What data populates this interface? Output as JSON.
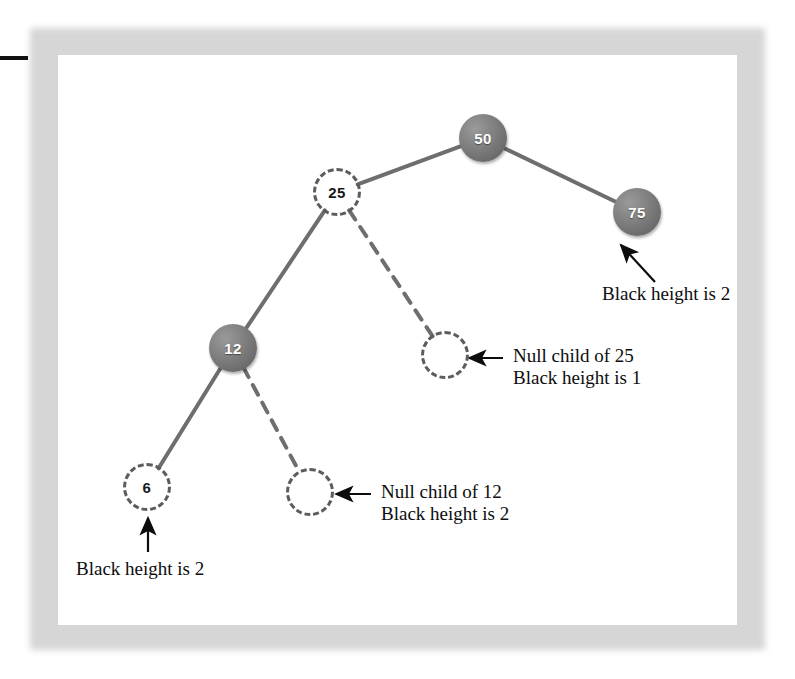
{
  "figure": {
    "kind": "red-black-tree-black-height-diagram",
    "page_background": "#ffffff",
    "frame_color": "#cfcfcf",
    "edge_color": "#6e6e6e",
    "black_node_fill": "#767676",
    "black_node_text_color": "#ffffff",
    "red_node_stroke": "#5c5c5c",
    "red_node_text_color": "#1a1a1a",
    "annotation_text_color": "#0d0d0d"
  },
  "nodes": [
    {
      "id": "n50",
      "label": "50",
      "color": "black",
      "filled": true,
      "cx": 483,
      "cy": 138,
      "r": 24
    },
    {
      "id": "n25",
      "label": "25",
      "color": "red",
      "filled": false,
      "cx": 337,
      "cy": 192,
      "r": 24
    },
    {
      "id": "n75",
      "label": "75",
      "color": "black",
      "filled": true,
      "cx": 637,
      "cy": 212,
      "r": 24
    },
    {
      "id": "n12",
      "label": "12",
      "color": "black",
      "filled": true,
      "cx": 233,
      "cy": 348,
      "r": 24
    },
    {
      "id": "null25",
      "label": "",
      "color": "null",
      "filled": false,
      "cx": 445,
      "cy": 355,
      "r": 24
    },
    {
      "id": "n6",
      "label": "6",
      "color": "red",
      "filled": false,
      "cx": 147,
      "cy": 487,
      "r": 24
    },
    {
      "id": "null12",
      "label": "",
      "color": "null",
      "filled": false,
      "cx": 310,
      "cy": 492,
      "r": 24
    }
  ],
  "edges": [
    {
      "from": "n50",
      "to": "n25",
      "style": "solid"
    },
    {
      "from": "n50",
      "to": "n75",
      "style": "solid"
    },
    {
      "from": "n25",
      "to": "n12",
      "style": "solid"
    },
    {
      "from": "n25",
      "to": "null25",
      "style": "dashed"
    },
    {
      "from": "n12",
      "to": "n6",
      "style": "solid"
    },
    {
      "from": "n12",
      "to": "null12",
      "style": "dashed"
    }
  ],
  "annotations": [
    {
      "id": "ann-75",
      "lines": [
        "Black height is 2"
      ],
      "x": 602,
      "y": 283,
      "arrow": {
        "x1": 655,
        "y1": 282,
        "x2": 621,
        "y2": 245
      }
    },
    {
      "id": "ann-null25",
      "lines": [
        "Null child of 25",
        "Black height is 1"
      ],
      "x": 513,
      "y": 345,
      "arrow": {
        "x1": 503,
        "y1": 358,
        "x2": 469,
        "y2": 358
      }
    },
    {
      "id": "ann-null12",
      "lines": [
        "Null child of 12",
        "Black height is 2"
      ],
      "x": 381,
      "y": 481,
      "arrow": {
        "x1": 371,
        "y1": 494,
        "x2": 336,
        "y2": 494
      }
    },
    {
      "id": "ann-6",
      "lines": [
        "Black height is 2"
      ],
      "x": 76,
      "y": 558,
      "arrow": {
        "x1": 148,
        "y1": 552,
        "x2": 148,
        "y2": 518
      }
    }
  ]
}
